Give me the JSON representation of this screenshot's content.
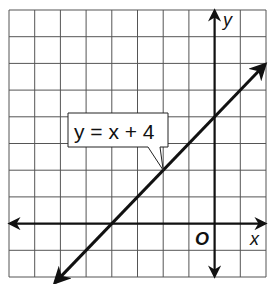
{
  "diagram": {
    "type": "coordinate-plane-line-graph",
    "grid": {
      "x_min": -8,
      "x_max": 2,
      "y_min": -2,
      "y_max": 8,
      "step": 1,
      "pixel_left": 9,
      "pixel_right": 266,
      "pixel_top": 10,
      "pixel_bottom": 277
    },
    "axes": {
      "x_label": "x",
      "y_label": "y",
      "origin_label": "O"
    },
    "line": {
      "equation": "y = x + 4",
      "slope": 1,
      "y_intercept": 4,
      "x_intercept": -4,
      "arrows_both_ends": true
    },
    "callout": {
      "text": "y = x + 4",
      "points_to": [
        -2,
        2
      ]
    },
    "colors": {
      "grid": "#555555",
      "axes": "#111111",
      "line": "#111111",
      "background": "#ffffff"
    }
  }
}
